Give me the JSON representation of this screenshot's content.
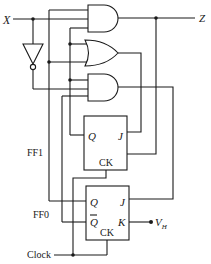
{
  "diagram": {
    "type": "sequential logic circuit",
    "input_label": "X",
    "output_label": "Z",
    "clock_label": "Clock",
    "supply_label": "V",
    "supply_subscript": "H",
    "gates": [
      {
        "id": "and1",
        "kind": "AND",
        "inputs": 3
      },
      {
        "id": "or1",
        "kind": "OR",
        "inputs": 2
      },
      {
        "id": "and2",
        "kind": "AND",
        "inputs": 3
      },
      {
        "id": "inv1",
        "kind": "NOT",
        "inputs": 1
      }
    ],
    "flipflops": [
      {
        "name": "FF1",
        "pins": {
          "q": "Q",
          "j": "J",
          "ck": "CK"
        }
      },
      {
        "name": "FF0",
        "pins": {
          "q": "Q",
          "qbar": "Q",
          "j": "J",
          "k": "K",
          "ck": "CK"
        }
      }
    ]
  }
}
